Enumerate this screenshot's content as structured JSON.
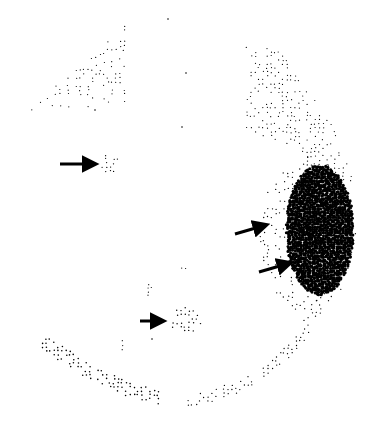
{
  "figure": {
    "type": "visual-field-grayscale-plot",
    "background": "#ffffff",
    "ink": "#000000",
    "dot_regions": [
      {
        "name": "superior-nasal-depression",
        "shape": "poly",
        "points": [
          [
            28,
            112
          ],
          [
            125,
            22
          ],
          [
            125,
            102
          ],
          [
            70,
            110
          ]
        ],
        "density": 0.35,
        "dot": 1.0
      },
      {
        "name": "superior-temporal-depression",
        "shape": "poly",
        "points": [
          [
            245,
            44
          ],
          [
            280,
            50
          ],
          [
            330,
            120
          ],
          [
            355,
            182
          ],
          [
            330,
            180
          ],
          [
            300,
            150
          ],
          [
            243,
            128
          ],
          [
            250,
            80
          ]
        ],
        "density": 0.45,
        "dot": 1.0
      },
      {
        "name": "small-paracentral-scotoma",
        "shape": "ellipse",
        "cx": 110,
        "cy": 164,
        "rx": 12,
        "ry": 9,
        "density": 0.6,
        "dot": 1.1
      },
      {
        "name": "blind-spot-dense",
        "shape": "ellipse",
        "cx": 320,
        "cy": 230,
        "rx": 34,
        "ry": 65,
        "density": 1.0,
        "dot": 2.6
      },
      {
        "name": "blind-spot-halo",
        "shape": "ellipse",
        "cx": 308,
        "cy": 235,
        "rx": 48,
        "ry": 78,
        "density": 0.35,
        "dot": 1.1
      },
      {
        "name": "inferior-paracentral-scotoma",
        "shape": "ellipse",
        "cx": 185,
        "cy": 321,
        "rx": 16,
        "ry": 14,
        "density": 0.75,
        "dot": 1.2
      },
      {
        "name": "inferior-nasal-arc",
        "shape": "band",
        "points": [
          [
            48,
            345
          ],
          [
            90,
            372
          ],
          [
            130,
            390
          ],
          [
            160,
            398
          ]
        ],
        "width": 14,
        "density": 0.7,
        "dot": 1.3
      },
      {
        "name": "inferior-temporal-arc",
        "shape": "band",
        "points": [
          [
            188,
            402
          ],
          [
            230,
            390
          ],
          [
            270,
            370
          ],
          [
            300,
            340
          ],
          [
            318,
            305
          ]
        ],
        "width": 12,
        "density": 0.55,
        "dot": 1.1
      },
      {
        "name": "scatter-1",
        "shape": "ellipse",
        "cx": 145,
        "cy": 255,
        "rx": 6,
        "ry": 5,
        "density": 0.25,
        "dot": 1.0
      },
      {
        "name": "scatter-2",
        "shape": "ellipse",
        "cx": 182,
        "cy": 268,
        "rx": 4,
        "ry": 8,
        "density": 0.3,
        "dot": 1.0
      },
      {
        "name": "scatter-3",
        "shape": "ellipse",
        "cx": 233,
        "cy": 262,
        "rx": 8,
        "ry": 6,
        "density": 0.25,
        "dot": 1.0
      },
      {
        "name": "scatter-4",
        "shape": "ellipse",
        "cx": 150,
        "cy": 291,
        "rx": 6,
        "ry": 7,
        "density": 0.45,
        "dot": 1.0
      },
      {
        "name": "scatter-5",
        "shape": "ellipse",
        "cx": 230,
        "cy": 325,
        "rx": 6,
        "ry": 6,
        "density": 0.25,
        "dot": 1.0
      },
      {
        "name": "scatter-6",
        "shape": "ellipse",
        "cx": 122,
        "cy": 345,
        "rx": 4,
        "ry": 12,
        "density": 0.2,
        "dot": 1.0
      }
    ],
    "isolated_dots": [
      [
        168,
        19
      ],
      [
        186,
        73
      ],
      [
        182,
        127
      ],
      [
        95,
        110
      ],
      [
        152,
        339
      ]
    ],
    "arrows": [
      {
        "name": "arrow-paracentral",
        "x1": 60,
        "y1": 164,
        "x2": 95,
        "y2": 164
      },
      {
        "name": "arrow-blind-spot-upper",
        "x1": 235,
        "y1": 234,
        "x2": 266,
        "y2": 225
      },
      {
        "name": "arrow-blind-spot-lower",
        "x1": 259,
        "y1": 272,
        "x2": 290,
        "y2": 263
      },
      {
        "name": "arrow-inferior-paracentral",
        "x1": 140,
        "y1": 321,
        "x2": 163,
        "y2": 321
      }
    ]
  }
}
